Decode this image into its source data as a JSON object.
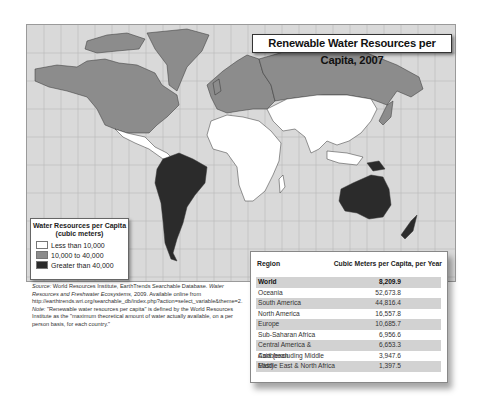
{
  "title": "Renewable Water Resources per Capita, 2007",
  "colors": {
    "ocean": "#d9d9d9",
    "low": "#ffffff",
    "mid": "#8c8c8c",
    "high": "#2b2b2b",
    "gridline": "#b5b5b5"
  },
  "legend": {
    "title_line1": "Water Resources per Capita",
    "title_line2": "(cubic meters)",
    "items": [
      {
        "label": "Less than 10,000",
        "color": "#ffffff"
      },
      {
        "label": "10,000 to 40,000",
        "color": "#8c8c8c"
      },
      {
        "label": "Greater than 40,000",
        "color": "#2b2b2b"
      }
    ]
  },
  "source": {
    "source_label": "Source:",
    "source_text": "World Resources Institute, EarthTrends Searchable Database.",
    "source_italic": "Water Resources and Freshwater Ecosystems,",
    "source_text2": "2009. Available online from http://earthtrends.wri.org/searchable_db/index.php?action=select_variable&theme=2.",
    "note_label": "Note:",
    "note_text": "\"Renewable water resources per capita\" is defined by the World Resources Institute as the \"maximum theoretical amount of water actually available, on a per person basis, for each country.\""
  },
  "table": {
    "headers": [
      "Region",
      "Cubic Meters per Capita, per Year"
    ],
    "rows": [
      {
        "region": "World",
        "value": "8,209.9"
      },
      {
        "region": "Oceania",
        "value": "52,673.8"
      },
      {
        "region": "South America",
        "value": "44,816.4"
      },
      {
        "region": "North America",
        "value": "16,557.8"
      },
      {
        "region": "Europe",
        "value": "10,685.7"
      },
      {
        "region": "Sub-Saharan Africa",
        "value": "6,956.6"
      },
      {
        "region": "Central America & Caribbean",
        "value": "6,653.3"
      },
      {
        "region": "Asia (excluding Middle East)",
        "value": "3,947.6"
      },
      {
        "region": "Middle East & North Africa",
        "value": "1,397.5"
      }
    ]
  },
  "map_regions": [
    {
      "name": "North America",
      "category": "10,000 to 40,000"
    },
    {
      "name": "Greenland",
      "category": "10,000 to 40,000"
    },
    {
      "name": "Mexico & Central America",
      "category": "Less than 10,000"
    },
    {
      "name": "South America",
      "category": "Greater than 40,000"
    },
    {
      "name": "Europe",
      "category": "10,000 to 40,000"
    },
    {
      "name": "Russia",
      "category": "10,000 to 40,000"
    },
    {
      "name": "Africa",
      "category": "Less than 10,000"
    },
    {
      "name": "Middle East & Asia",
      "category": "Less than 10,000"
    },
    {
      "name": "Australia",
      "category": "Greater than 40,000"
    },
    {
      "name": "New Zealand",
      "category": "Greater than 40,000"
    },
    {
      "name": "Papua New Guinea",
      "category": "Greater than 40,000"
    }
  ]
}
